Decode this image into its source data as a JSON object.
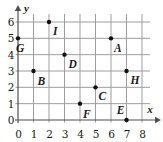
{
  "figure": {
    "background": "#ffffff",
    "colors": {
      "grid": "#9d9d9d",
      "axis": "#4f4f4f",
      "point": "#111111",
      "text": "#1a1a1a"
    }
  },
  "chart_data": {
    "type": "scatter",
    "title": "",
    "xlabel": "x",
    "ylabel": "y",
    "xlim": [
      0,
      8
    ],
    "ylim": [
      0,
      6
    ],
    "grid": true,
    "x_ticks": [
      0,
      1,
      2,
      3,
      4,
      5,
      6,
      7,
      8
    ],
    "y_ticks": [
      0,
      1,
      2,
      3,
      4,
      5,
      6
    ],
    "points": [
      {
        "label": "A",
        "x": 6,
        "y": 5,
        "dx": 3,
        "dy": 14,
        "anchor": "start"
      },
      {
        "label": "B",
        "x": 1,
        "y": 3,
        "dx": 4,
        "dy": 14,
        "anchor": "start"
      },
      {
        "label": "C",
        "x": 5,
        "y": 2,
        "dx": 3,
        "dy": 13,
        "anchor": "start"
      },
      {
        "label": "D",
        "x": 3,
        "y": 4,
        "dx": 4,
        "dy": 13,
        "anchor": "start"
      },
      {
        "label": "E",
        "x": 7,
        "y": 0,
        "dx": -2,
        "dy": -6,
        "anchor": "end"
      },
      {
        "label": "F",
        "x": 4,
        "y": 1,
        "dx": 3,
        "dy": 14,
        "anchor": "start"
      },
      {
        "label": "G",
        "x": 0,
        "y": 5,
        "dx": -2,
        "dy": 14,
        "anchor": "start"
      },
      {
        "label": "H",
        "x": 7,
        "y": 3,
        "dx": 4,
        "dy": 13,
        "anchor": "start"
      },
      {
        "label": "I",
        "x": 2,
        "y": 6,
        "dx": 4,
        "dy": 13,
        "anchor": "start"
      }
    ]
  }
}
